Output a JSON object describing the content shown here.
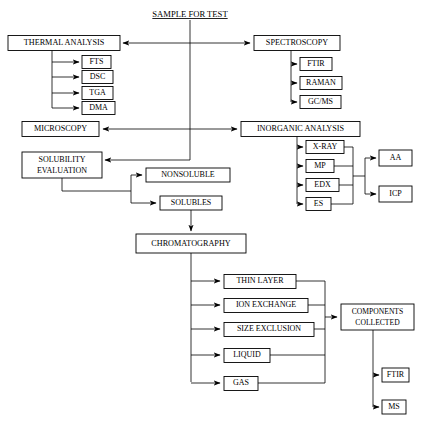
{
  "diagram": {
    "title": "SAMPLE FOR TEST",
    "type": "flowchart",
    "nodes": {
      "title_node": "SAMPLE FOR TEST",
      "thermal_analysis": "THERMAL  ANALYSIS",
      "fts": "FTS",
      "dsc": "DSC",
      "tga": "TGA",
      "dma": "DMA",
      "spectroscopy": "SPECTROSCOPY",
      "ftir_top": "FTIR",
      "raman": "RAMAN",
      "gcms": "GC/MS",
      "microscopy": "MICROSCOPY",
      "inorganic_analysis": "INORGANIC ANALYSIS",
      "xray": "X-RAY",
      "mp": "MP",
      "edx": "EDX",
      "es": "ES",
      "aa": "AA",
      "icp": "ICP",
      "solubility_evaluation_line1": "SOLUBILITY",
      "solubility_evaluation_line2": "EVALUATION",
      "nonsoluble": "NONSOLUBLE",
      "solubles": "SOLUBLES",
      "chromatography": "CHROMATOGRAPHY",
      "thin_layer": "THIN LAYER",
      "ion_exchange": "ION EXCHANGE",
      "size_exclusion": "SIZE EXCLUSION",
      "liquid": "LIQUID",
      "gas": "GAS",
      "components_collected_line1": "COMPONENTS",
      "components_collected_line2": "COLLECTED",
      "ftir_bottom": "FTIR",
      "ms": "MS"
    },
    "colors": {
      "background": "#ffffff",
      "stroke": "#000000",
      "text": "#000000",
      "box_fill": "#ffffff"
    }
  }
}
